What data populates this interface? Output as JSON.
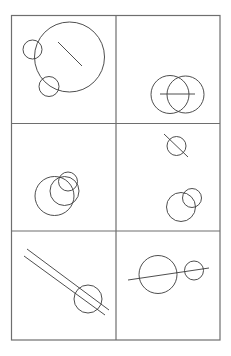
{
  "canvas": {
    "width": 231,
    "height": 356,
    "background": "#ffffff"
  },
  "colors": {
    "border": "#6e6e6e",
    "stroke": "#3a3a3a"
  },
  "grid": {
    "left": 11.5,
    "top": 15.5,
    "right": 220,
    "bottom": 340,
    "col_divider_x": 116,
    "row_divider_y": [
      123.5,
      231
    ]
  },
  "panels": [
    {
      "id": "panel-1",
      "position": "top-left",
      "circles": [
        {
          "cx": 69.5,
          "cy": 57,
          "r": 35
        },
        {
          "cx": 32.5,
          "cy": 49.5,
          "r": 9.5
        },
        {
          "cx": 49,
          "cy": 86.5,
          "r": 10
        }
      ],
      "lines": [
        {
          "x1": 58,
          "y1": 42,
          "x2": 82,
          "y2": 66
        }
      ]
    },
    {
      "id": "panel-2",
      "position": "top-right",
      "circles": [
        {
          "cx": 170,
          "cy": 94.5,
          "r": 19
        },
        {
          "cx": 185.5,
          "cy": 94.5,
          "r": 18.5
        }
      ],
      "lines": [
        {
          "x1": 160,
          "y1": 94,
          "x2": 195,
          "y2": 94
        }
      ]
    },
    {
      "id": "panel-3",
      "position": "middle-left",
      "circles": [
        {
          "cx": 54.5,
          "cy": 196,
          "r": 19.5
        },
        {
          "cx": 64.5,
          "cy": 191,
          "r": 14.5
        },
        {
          "cx": 68,
          "cy": 181.5,
          "r": 9.5
        }
      ],
      "lines": []
    },
    {
      "id": "panel-4",
      "position": "middle-right",
      "circles": [
        {
          "cx": 176.5,
          "cy": 146,
          "r": 9.5
        },
        {
          "cx": 181,
          "cy": 207,
          "r": 14.5
        },
        {
          "cx": 192,
          "cy": 198,
          "r": 9.5
        }
      ],
      "lines": [
        {
          "x1": 164,
          "y1": 134,
          "x2": 188,
          "y2": 157
        }
      ]
    },
    {
      "id": "panel-5",
      "position": "bottom-left",
      "circles": [
        {
          "cx": 88,
          "cy": 299,
          "r": 14
        }
      ],
      "lines": [
        {
          "x1": 27,
          "y1": 249,
          "x2": 109,
          "y2": 310
        },
        {
          "x1": 24,
          "y1": 256,
          "x2": 105,
          "y2": 315
        }
      ]
    },
    {
      "id": "panel-6",
      "position": "bottom-right",
      "circles": [
        {
          "cx": 158,
          "cy": 274.5,
          "r": 19
        },
        {
          "cx": 194,
          "cy": 270.5,
          "r": 9.5
        }
      ],
      "lines": [
        {
          "x1": 128,
          "y1": 280,
          "x2": 209,
          "y2": 268
        }
      ]
    }
  ]
}
